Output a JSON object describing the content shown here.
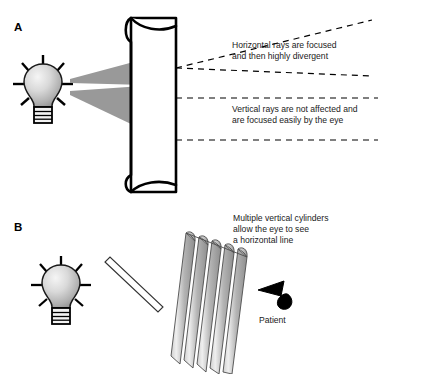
{
  "figure": {
    "title_alt": "Astigmatism cylinder lens diagram",
    "background_color": "#ffffff",
    "ink_color": "#000000",
    "ray_fill_color": "#999999",
    "cylinder_fill_color": "#a8a8a8",
    "bulb_highlight_color": "#f2f2f2",
    "bulb_shadow_color": "#8c8c8c"
  },
  "panels": [
    {
      "id": "A",
      "label": "A",
      "label_x": 14,
      "label_y": 31,
      "elements": {
        "bulb": {
          "name": "light-bulb",
          "cx": 43,
          "cy": 86
        },
        "cylinder_lens": {
          "name": "vertical-cylinder-lens"
        },
        "ray_cone_upper": {
          "name": "horizontal-ray-cone"
        },
        "ray_cone_lower": {
          "name": "vertical-ray-cone"
        }
      },
      "annotations": [
        {
          "name": "horizontal-rays-annotation",
          "x": 232,
          "y": 50,
          "lines": [
            "Horizontal rays are focused",
            "and then highly divergent"
          ]
        },
        {
          "name": "vertical-rays-annotation",
          "x": 232,
          "y": 111,
          "lines": [
            "Vertical rays are not affected and",
            "are focused easily by the eye"
          ]
        }
      ]
    },
    {
      "id": "B",
      "label": "B",
      "label_x": 14,
      "label_y": 231,
      "elements": {
        "bulb": {
          "name": "light-bulb",
          "cx": 57,
          "cy": 285
        },
        "slit_target": {
          "name": "slit-line-target"
        },
        "cylinder_array": {
          "name": "multiple-vertical-cylinders",
          "count": 5
        },
        "eye": {
          "name": "patient-eye"
        }
      },
      "annotations": [
        {
          "name": "multiple-cylinders-annotation",
          "x": 233,
          "y": 221,
          "lines": [
            "Multiple vertical cylinders",
            "allow the eye to see",
            "a horizontal line"
          ]
        }
      ],
      "captions": [
        {
          "name": "patient-caption",
          "x": 259,
          "y": 320,
          "text": "Patient"
        }
      ]
    }
  ],
  "annotation_text": {
    "horizontal_line1": "Horizontal rays are focused",
    "horizontal_line2": "and then highly divergent",
    "vertical_line1": "Vertical rays are not affected and",
    "vertical_line2": "are focused easily by the eye",
    "cylinders_line1": "Multiple vertical cylinders",
    "cylinders_line2": "allow the eye to see",
    "cylinders_line3": "a horizontal line",
    "patient_label": "Patient",
    "panel_a_label": "A",
    "panel_b_label": "B"
  }
}
